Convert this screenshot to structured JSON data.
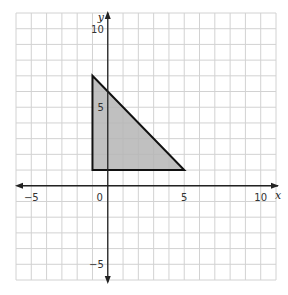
{
  "chart_data": {
    "type": "polygon-on-grid",
    "title": "",
    "xlabel": "x",
    "ylabel": "y",
    "xlim": [
      -6,
      11
    ],
    "ylim": [
      -6,
      11
    ],
    "grid": true,
    "grid_step": 1,
    "x_ticks": [
      {
        "value": -5,
        "label": "−5"
      },
      {
        "value": 0,
        "label": "0"
      },
      {
        "value": 5,
        "label": "5"
      },
      {
        "value": 10,
        "label": "10"
      }
    ],
    "y_ticks": [
      {
        "value": 10,
        "label": "10"
      },
      {
        "value": 5,
        "label": "5"
      },
      {
        "value": -5,
        "label": "−5"
      }
    ],
    "shapes": [
      {
        "name": "triangle",
        "vertices": [
          [
            -1,
            1
          ],
          [
            -1,
            7
          ],
          [
            5,
            1
          ]
        ],
        "fill": "#b5b5b5",
        "stroke": "#111111"
      }
    ]
  },
  "colors": {
    "grid": "#d2d2d2",
    "axis": "#222222",
    "background": "#ffffff"
  }
}
